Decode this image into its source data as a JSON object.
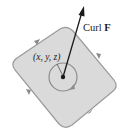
{
  "diagram": {
    "labels": {
      "vector": "Curl ",
      "vector_bold": "F",
      "point": "(x, y, z)"
    },
    "colors": {
      "surface_fill": "#d9d9d9",
      "surface_stroke": "#9a9a9a",
      "circle_stroke": "#8c8c8c",
      "vector": "#1a1a1a",
      "background": "#ffffff"
    }
  }
}
